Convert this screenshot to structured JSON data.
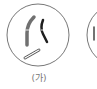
{
  "diagram": {
    "type": "cell-chromosome-illustration",
    "cells": [
      {
        "label": "(가)",
        "chromosomes": [
          {
            "description": "long chromosome, light gray with band at centromere",
            "color": "#6e6e6e"
          },
          {
            "description": "dark chromosome, bent",
            "color": "#1e1e1e"
          },
          {
            "description": "small outlined chromosome, diagonal",
            "color": "#555555"
          }
        ]
      },
      {
        "label": "",
        "partial": true,
        "chromosomes": [
          {
            "description": "partially visible dark chromosome",
            "color": "#333333"
          }
        ]
      }
    ],
    "colors": {
      "cell_outline": "#777777",
      "label_text": "#777777"
    }
  }
}
